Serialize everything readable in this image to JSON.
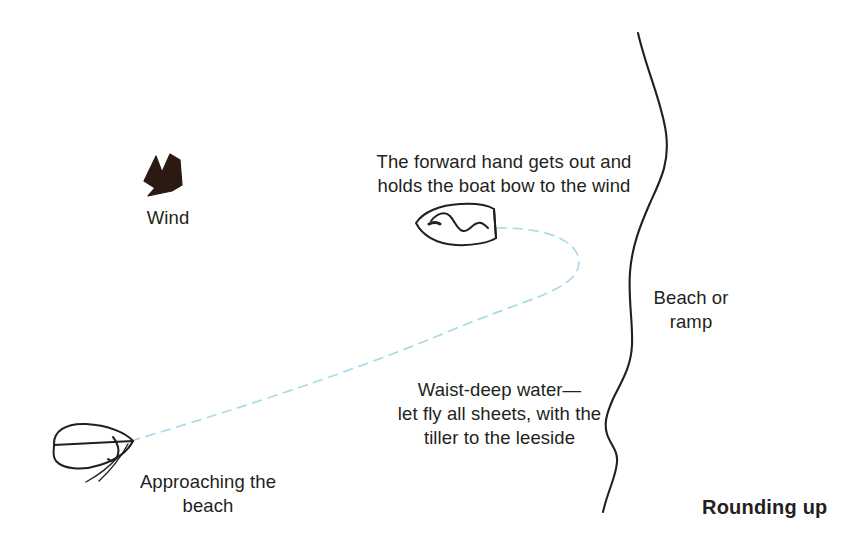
{
  "figure": {
    "title": "Rounding up",
    "width": 863,
    "height": 558,
    "background_color": "#ffffff",
    "ink_color": "#231f20",
    "track_color": "#a8dce8",
    "wind_arrow_color": "#2b1a12"
  },
  "labels": {
    "wind": "Wind",
    "forward_hand": "The forward hand gets out and\nholds the boat bow to the wind",
    "waist_deep": "Waist-deep water—\nlet fly all sheets, with the\ntiller to the leeside",
    "approaching": "Approaching the\nbeach",
    "beach_or_ramp": "Beach or\nramp"
  },
  "elements": {
    "wind_arrow_name": "wind-arrow-icon",
    "shoreline_name": "shoreline-curve",
    "track_name": "boat-track-dashed-path",
    "boat_upper_name": "boat-at-beach",
    "boat_lower_name": "boat-approaching"
  }
}
